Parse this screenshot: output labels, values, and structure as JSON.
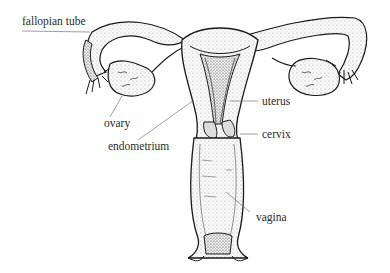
{
  "diagram": {
    "labels": {
      "fallopian_tube": "fallopian tube",
      "ovary": "ovary",
      "endometrium": "endometrium",
      "uterus": "uterus",
      "cervix": "cervix",
      "vagina": "vagina"
    },
    "colors": {
      "ink": "#1a1a1a",
      "leader": "#777777",
      "fill": "#f4f4f4",
      "background": "#ffffff"
    }
  }
}
